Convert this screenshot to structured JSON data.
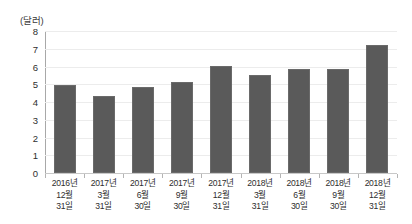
{
  "chart_data": {
    "type": "bar",
    "title": "",
    "subtitle": "",
    "xlabel": "",
    "ylabel": "(달러)",
    "unit_caption": "(달러)",
    "categories": [
      "2016년\n12월\n31일",
      "2017년\n3월\n31일",
      "2017년\n6월\n30일",
      "2017년\n9월\n30일",
      "2017년\n12월\n31일",
      "2018년\n3월\n31일",
      "2018년\n6월\n30일",
      "2018년\n9월\n30일",
      "2018년\n12월\n31일"
    ],
    "category_lines": [
      [
        "2016년",
        "12월",
        "31일"
      ],
      [
        "2017년",
        "3월",
        "31일"
      ],
      [
        "2017년",
        "6월",
        "30일"
      ],
      [
        "2017년",
        "9월",
        "30일"
      ],
      [
        "2017년",
        "12월",
        "31일"
      ],
      [
        "2018년",
        "3월",
        "31일"
      ],
      [
        "2018년",
        "6월",
        "30일"
      ],
      [
        "2018년",
        "9월",
        "30일"
      ],
      [
        "2018년",
        "12월",
        "31일"
      ]
    ],
    "values": [
      4.95,
      4.35,
      4.85,
      5.1,
      6.05,
      5.55,
      5.85,
      5.85,
      7.2
    ],
    "ylim": [
      0,
      8
    ],
    "ytick_labels": [
      "8",
      "7",
      "6",
      "5",
      "4",
      "3",
      "2",
      "1",
      "0"
    ],
    "yticks": [
      8,
      7,
      6,
      5,
      4,
      3,
      2,
      1,
      0
    ],
    "grid": true,
    "legend": false,
    "legend_position": "none",
    "series": [
      {
        "name": "",
        "values": [
          4.95,
          4.35,
          4.85,
          5.1,
          6.05,
          5.55,
          5.85,
          5.85,
          7.2
        ]
      }
    ],
    "colors": {
      "bar": "#5a5a5a",
      "bar_border": "#6a6a6a",
      "gridline": "#ececec",
      "axis": "#a8a8a8",
      "baseline": "#c8c8c8",
      "text": "#2e2e2e",
      "background": "#ffffff"
    }
  }
}
